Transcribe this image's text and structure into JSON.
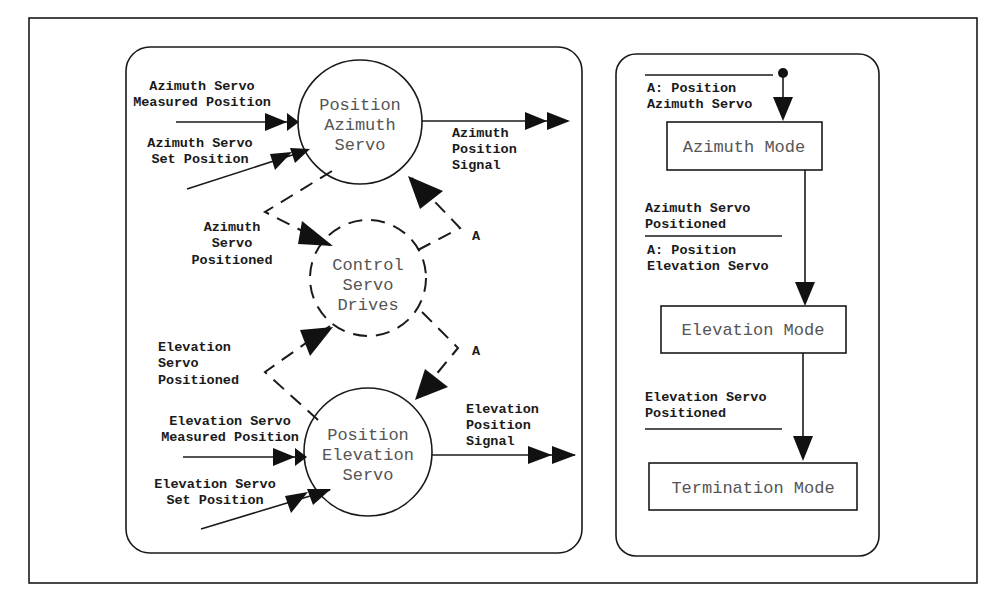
{
  "colors": {
    "ink": "#1a1a1a",
    "node_text": "#555555",
    "background": "#ffffff"
  },
  "flow_diagram": {
    "processes": {
      "position_azimuth": {
        "line1": "Position",
        "line2": "Azimuth",
        "line3": "Servo"
      },
      "control_servo_drives": {
        "line1": "Control",
        "line2": "Servo",
        "line3": "Drives"
      },
      "position_elevation": {
        "line1": "Position",
        "line2": "Elevation",
        "line3": "Servo"
      }
    },
    "flows": {
      "az_measured": {
        "line1": "Azimuth Servo",
        "line2": "Measured Position"
      },
      "az_set": {
        "line1": "Azimuth Servo",
        "line2": "Set Position"
      },
      "az_signal": {
        "line1": "Azimuth",
        "line2": "Position",
        "line3": "Signal"
      },
      "az_positioned": {
        "line1": "Azimuth",
        "line2": "Servo",
        "line3": "Positioned"
      },
      "el_positioned": {
        "line1": "Elevation",
        "line2": "Servo",
        "line3": "Positioned"
      },
      "el_measured": {
        "line1": "Elevation Servo",
        "line2": "Measured Position"
      },
      "el_set": {
        "line1": "Elevation Servo",
        "line2": "Set Position"
      },
      "el_signal": {
        "line1": "Elevation",
        "line2": "Position",
        "line3": "Signal"
      },
      "activate_az": "A",
      "activate_el": "A"
    }
  },
  "state_diagram": {
    "states": [
      "Azimuth Mode",
      "Elevation Mode",
      "Termination Mode"
    ],
    "transitions": {
      "initial": {
        "condition": "",
        "action_line1": "A: Position",
        "action_line2": "Azimuth Servo"
      },
      "az_to_el": {
        "condition_line1": "Azimuth Servo",
        "condition_line2": "Positioned",
        "action_line1": "A: Position",
        "action_line2": "Elevation Servo"
      },
      "el_to_term": {
        "condition_line1": "Elevation Servo",
        "condition_line2": "Positioned"
      }
    }
  }
}
